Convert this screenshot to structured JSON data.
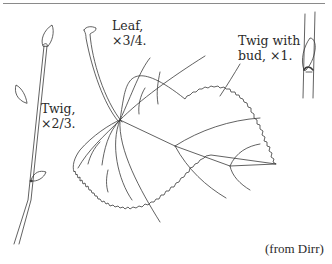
{
  "figure": {
    "labels": {
      "twig_line1": "Twig,",
      "twig_line2": "×2/3.",
      "leaf_line1": "Leaf,",
      "leaf_line2": "×3/4.",
      "bud_line1": "Twig with",
      "bud_line2": "bud, ×1."
    },
    "credit": "(from Dirr)",
    "colors": {
      "line": "#3a3a3a",
      "rule": "#8a8a8a",
      "background": "#ffffff"
    }
  }
}
